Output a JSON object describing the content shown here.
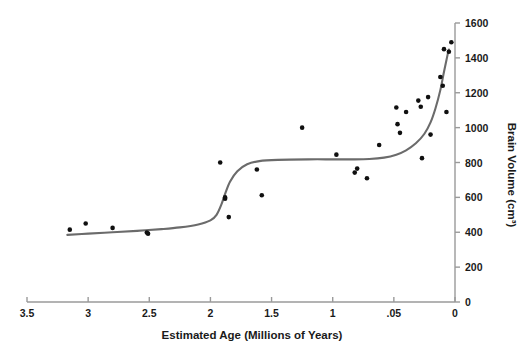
{
  "chart_data": {
    "type": "scatter",
    "title": "",
    "xlabel": "Estimated Age (Millions of Years)",
    "ylabel": "Brain Volume (cm³)",
    "xlim": [
      3.5,
      0
    ],
    "ylim": [
      0,
      1600
    ],
    "x_axis_reversed": true,
    "y_axis_position": "right",
    "grid": false,
    "legend": null,
    "xticks": [
      {
        "value": 3.5,
        "label": "3.5"
      },
      {
        "value": 3.0,
        "label": "3"
      },
      {
        "value": 2.5,
        "label": "2.5"
      },
      {
        "value": 2.0,
        "label": "2"
      },
      {
        "value": 1.5,
        "label": "1.5"
      },
      {
        "value": 1.0,
        "label": "1"
      },
      {
        "value": 0.5,
        "label": ".05"
      },
      {
        "value": 0.0,
        "label": "0"
      }
    ],
    "yticks": [
      {
        "value": 0,
        "label": "0"
      },
      {
        "value": 200,
        "label": "200"
      },
      {
        "value": 400,
        "label": "400"
      },
      {
        "value": 600,
        "label": "600"
      },
      {
        "value": 800,
        "label": "800"
      },
      {
        "value": 1000,
        "label": "1000"
      },
      {
        "value": 1200,
        "label": "1200"
      },
      {
        "value": 1400,
        "label": "1400"
      },
      {
        "value": 1600,
        "label": "1600"
      }
    ],
    "series": [
      {
        "name": "Brain volume specimens",
        "marker": "dot",
        "color": "#101010",
        "points": [
          [
            3.15,
            415
          ],
          [
            3.02,
            450
          ],
          [
            2.8,
            425
          ],
          [
            2.52,
            398
          ],
          [
            2.51,
            392
          ],
          [
            1.92,
            800
          ],
          [
            1.88,
            600
          ],
          [
            1.88,
            592
          ],
          [
            1.85,
            487
          ],
          [
            1.62,
            760
          ],
          [
            1.58,
            612
          ],
          [
            1.25,
            1000
          ],
          [
            0.97,
            845
          ],
          [
            0.82,
            742
          ],
          [
            0.8,
            765
          ],
          [
            0.72,
            710
          ],
          [
            0.62,
            900
          ],
          [
            0.48,
            1115
          ],
          [
            0.47,
            1020
          ],
          [
            0.45,
            970
          ],
          [
            0.4,
            1090
          ],
          [
            0.3,
            1155
          ],
          [
            0.28,
            1120
          ],
          [
            0.27,
            825
          ],
          [
            0.22,
            1175
          ],
          [
            0.2,
            960
          ],
          [
            0.12,
            1290
          ],
          [
            0.1,
            1240
          ],
          [
            0.09,
            1450
          ],
          [
            0.07,
            1090
          ],
          [
            0.05,
            1435
          ],
          [
            0.03,
            1490
          ]
        ]
      }
    ],
    "trend_curve": {
      "name": "Fitted trend (double sigmoid)",
      "color": "#6b6b6b",
      "points": [
        [
          3.17,
          385
        ],
        [
          3.0,
          392
        ],
        [
          2.8,
          400
        ],
        [
          2.6,
          408
        ],
        [
          2.4,
          418
        ],
        [
          2.25,
          428
        ],
        [
          2.1,
          445
        ],
        [
          2.0,
          468
        ],
        [
          1.95,
          500
        ],
        [
          1.91,
          560
        ],
        [
          1.88,
          620
        ],
        [
          1.84,
          690
        ],
        [
          1.78,
          750
        ],
        [
          1.7,
          790
        ],
        [
          1.6,
          808
        ],
        [
          1.45,
          815
        ],
        [
          1.2,
          818
        ],
        [
          1.0,
          818
        ],
        [
          0.85,
          818
        ],
        [
          0.7,
          820
        ],
        [
          0.58,
          828
        ],
        [
          0.48,
          845
        ],
        [
          0.4,
          870
        ],
        [
          0.32,
          910
        ],
        [
          0.25,
          965
        ],
        [
          0.2,
          1030
        ],
        [
          0.16,
          1110
        ],
        [
          0.12,
          1215
        ],
        [
          0.09,
          1320
        ],
        [
          0.06,
          1420
        ],
        [
          0.05,
          1448
        ]
      ]
    }
  }
}
